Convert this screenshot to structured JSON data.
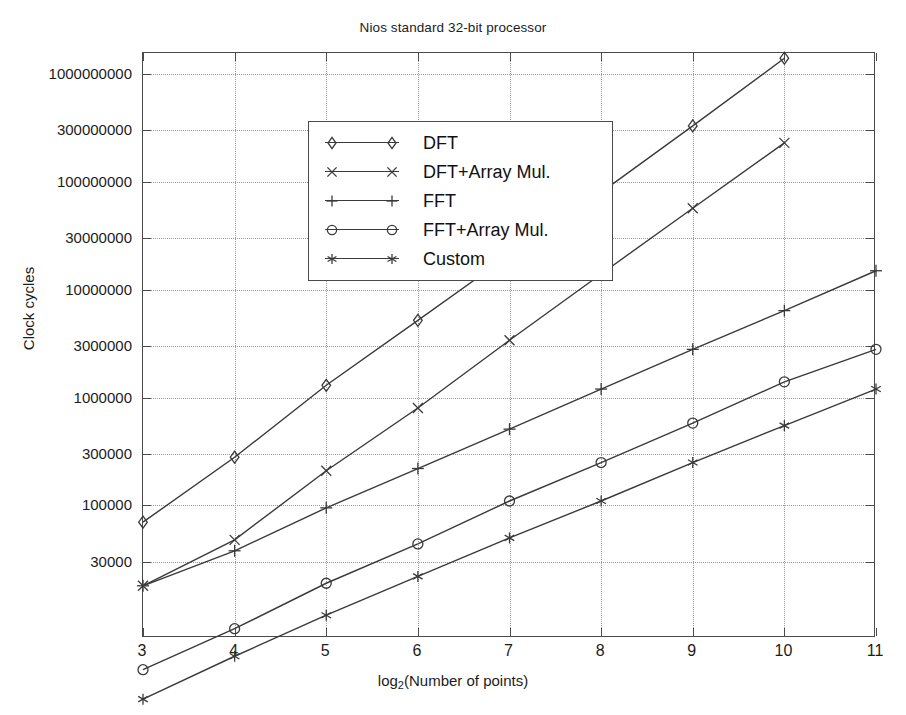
{
  "chart_data": {
    "type": "line",
    "title": "Nios standard 32-bit processor",
    "xlabel": "log₂(Number of points)",
    "ylabel": "Clock cycles",
    "yscale": "log",
    "grid": true,
    "legend_position": "upper-left-inside",
    "x": [
      3,
      4,
      5,
      6,
      7,
      8,
      9,
      10,
      11
    ],
    "xtick_labels": [
      "3",
      "4",
      "5",
      "6",
      "7",
      "8",
      "9",
      "10",
      "11"
    ],
    "xlim": [
      3,
      11
    ],
    "ylim": [
      3000,
      2000000000
    ],
    "ytick_labels": [
      "1000000000",
      "300000000",
      "100000000",
      "30000000",
      "10000000",
      "3000000",
      "1000000",
      "300000",
      "100000",
      "30000",
      "3000"
    ],
    "ytick_values": [
      1000000000,
      300000000,
      100000000,
      30000000,
      10000000,
      3000000,
      1000000,
      300000,
      100000,
      30000,
      3000
    ],
    "series": [
      {
        "name": "DFT",
        "marker": "diamond",
        "x": [
          3,
          4,
          5,
          6,
          7,
          8,
          9,
          10
        ],
        "values": [
          70000,
          280000,
          1300000,
          5200000,
          21000000,
          80000000,
          330000000,
          1400000000
        ]
      },
      {
        "name": "DFT+Array Mul.",
        "marker": "x",
        "x": [
          3,
          4,
          5,
          6,
          7,
          8,
          9,
          10
        ],
        "values": [
          18000,
          48000,
          210000,
          800000,
          3400000,
          14000000,
          57000000,
          230000000
        ]
      },
      {
        "name": "FFT",
        "marker": "plus",
        "x": [
          3,
          4,
          5,
          6,
          7,
          8,
          9,
          10,
          11
        ],
        "values": [
          18000,
          38000,
          95000,
          220000,
          510000,
          1200000,
          2800000,
          6400000,
          15000000
        ]
      },
      {
        "name": "FFT+Array Mul.",
        "marker": "circle",
        "x": [
          3,
          4,
          5,
          6,
          7,
          8,
          9,
          10,
          11
        ],
        "values": [
          3000,
          7200,
          19000,
          44000,
          110000,
          250000,
          580000,
          1400000,
          2800000
        ]
      },
      {
        "name": "Custom",
        "marker": "asterisk",
        "x": [
          3,
          4,
          5,
          6,
          7,
          8,
          9,
          10,
          11
        ],
        "values": [
          1600,
          4000,
          9600,
          22000,
          50000,
          110000,
          250000,
          550000,
          1200000
        ]
      }
    ],
    "legend_entries": [
      {
        "label": "DFT",
        "marker": "diamond"
      },
      {
        "label": "DFT+Array Mul.",
        "marker": "x"
      },
      {
        "label": "FFT",
        "marker": "plus"
      },
      {
        "label": "FFT+Array Mul.",
        "marker": "circle"
      },
      {
        "label": "Custom",
        "marker": "asterisk"
      }
    ],
    "line_color": "#3a3a3a",
    "axis_color": "#4a4a4a",
    "grid_color": "#9a9a9a",
    "background": "#ffffff"
  }
}
